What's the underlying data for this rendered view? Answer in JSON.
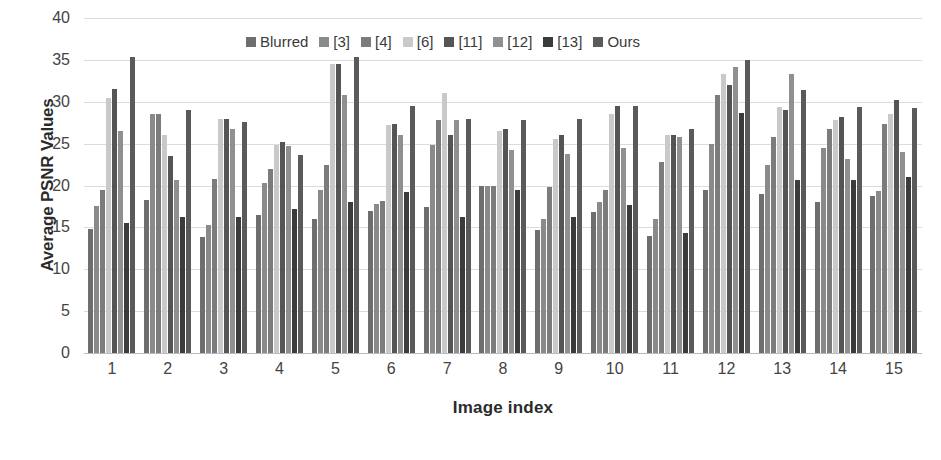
{
  "chart_data": {
    "type": "bar",
    "title": "",
    "xlabel": "Image index",
    "ylabel": "Average PSNR Values",
    "ylim": [
      0,
      40
    ],
    "ytick_step": 5,
    "yticks": [
      40,
      35,
      30,
      25,
      20,
      15,
      10,
      5,
      0
    ],
    "grid": true,
    "legend_position": "top-center",
    "categories": [
      "1",
      "2",
      "3",
      "4",
      "5",
      "6",
      "7",
      "8",
      "9",
      "10",
      "11",
      "12",
      "13",
      "14",
      "15"
    ],
    "series": [
      {
        "name": "Blurred",
        "color": "#6e6e6e",
        "values": [
          14.8,
          18.3,
          13.9,
          16.5,
          16.0,
          17.0,
          17.4,
          20.0,
          14.7,
          16.8,
          14.0,
          19.5,
          19.0,
          18.0,
          18.7
        ]
      },
      {
        "name": "[3]",
        "color": "#8a8a8a",
        "values": [
          17.5,
          28.5,
          15.3,
          20.3,
          19.5,
          17.8,
          24.8,
          20.0,
          16.0,
          18.0,
          16.0,
          25.0,
          22.5,
          24.5,
          19.3
        ]
      },
      {
        "name": "[4]",
        "color": "#7c7c7c",
        "values": [
          19.5,
          28.5,
          20.8,
          22.0,
          22.5,
          18.2,
          27.8,
          20.0,
          19.8,
          19.5,
          22.8,
          30.8,
          25.8,
          26.8,
          27.3
        ]
      },
      {
        "name": "[6]",
        "color": "#c9c9c9",
        "values": [
          30.5,
          26.0,
          28.0,
          24.8,
          34.5,
          27.2,
          31.0,
          26.5,
          25.5,
          28.5,
          26.0,
          33.3,
          29.4,
          27.8,
          28.5
        ]
      },
      {
        "name": "[11]",
        "color": "#555555",
        "values": [
          31.5,
          23.5,
          28.0,
          25.2,
          34.5,
          27.3,
          26.0,
          26.8,
          26.0,
          29.5,
          26.0,
          32.0,
          29.0,
          28.2,
          30.2
        ]
      },
      {
        "name": "[12]",
        "color": "#909090",
        "values": [
          26.5,
          20.7,
          26.8,
          24.7,
          30.8,
          26.0,
          27.8,
          24.3,
          23.8,
          24.5,
          25.8,
          34.2,
          33.3,
          23.2,
          24.0
        ]
      },
      {
        "name": "[13]",
        "color": "#3b3b3b",
        "values": [
          15.5,
          16.2,
          16.2,
          17.2,
          18.0,
          19.2,
          16.2,
          19.5,
          16.2,
          17.7,
          14.3,
          28.7,
          20.7,
          20.7,
          21.0
        ]
      },
      {
        "name": "Ours",
        "color": "#5a5a5a",
        "values": [
          35.3,
          29.0,
          27.6,
          23.7,
          35.3,
          29.5,
          27.9,
          27.8,
          28.0,
          29.5,
          26.7,
          35.0,
          31.4,
          29.4,
          29.3
        ]
      }
    ]
  }
}
